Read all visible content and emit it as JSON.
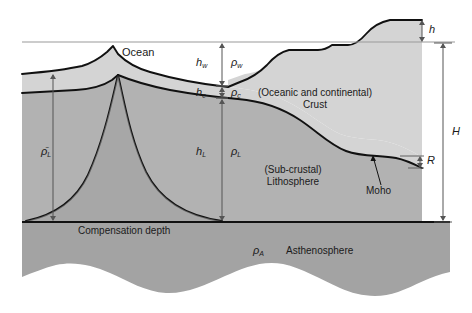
{
  "diagram": {
    "layers": {
      "ocean": "Ocean",
      "crust_line1": "(Oceanic and continental)",
      "crust_line2": "Crust",
      "lithosphere_line1": "(Sub-crustal)",
      "lithosphere_line2": "Lithosphere",
      "asthenosphere": "Asthenosphere"
    },
    "boundaries": {
      "moho": "Moho",
      "compensation_depth": "Compensation depth"
    },
    "symbols": {
      "h_water": "h",
      "h_water_sub": "w",
      "rho_water": "ρ",
      "rho_water_sub": "w",
      "h_crust": "h",
      "h_crust_sub": "c",
      "rho_crust": "ρ",
      "rho_crust_sub": "c",
      "h_lithosphere": "h",
      "h_lithosphere_sub": "L",
      "rho_lithosphere": "ρ",
      "rho_lithosphere_sub": "L",
      "rho_mean_lithosphere": "ρ̄",
      "rho_mean_lithosphere_sub": "L",
      "rho_asthenosphere": "ρ",
      "rho_asthenosphere_sub": "A",
      "elevation_h": "h",
      "total_H": "H",
      "root_R": "R"
    },
    "colors": {
      "ocean_fill": "#ffffff",
      "crust_fill": "#d2d2d2",
      "lithosphere_fill": "#b0b0b0",
      "asthenosphere_fill": "#a0a0a0",
      "outline": "#111111",
      "sea_level_line": "#9a9a9a",
      "arrow": "#555555"
    }
  }
}
